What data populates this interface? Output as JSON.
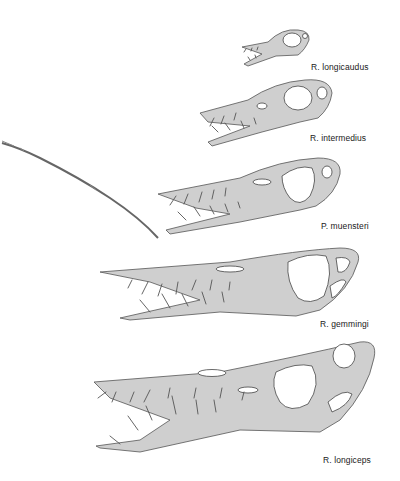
{
  "figure": {
    "background_color": "#ffffff",
    "ink_color": "#555555",
    "specimens": [
      {
        "id": "r-longicaudus",
        "label": "R. longicaudus"
      },
      {
        "id": "r-intermedius",
        "label": "R. intermedius"
      },
      {
        "id": "p-muensteri",
        "label": "P. muensteri"
      },
      {
        "id": "r-gemmingi",
        "label": "R. gemmingi"
      },
      {
        "id": "r-longiceps",
        "label": "R. longiceps"
      }
    ]
  }
}
